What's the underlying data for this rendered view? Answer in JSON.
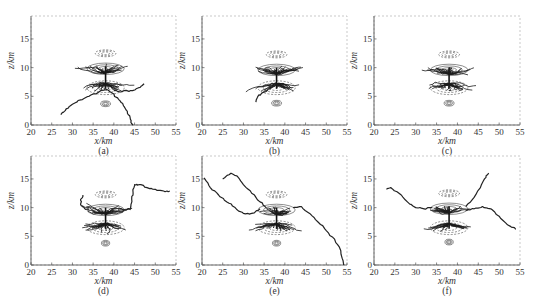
{
  "chart_data": [
    {
      "type": "line",
      "panel": "(a)",
      "xlabel": "x/km",
      "ylabel": "z/km",
      "xlim": [
        20,
        55
      ],
      "ylim": [
        0,
        19
      ],
      "xticks": [
        20,
        25,
        30,
        35,
        40,
        45,
        50,
        55
      ],
      "yticks": [
        0,
        5,
        10,
        15
      ],
      "grid": false,
      "charge_regions": [
        {
          "name": "upper-screening",
          "x": 38,
          "z": 12.5,
          "rx": 2.5,
          "rz": 0.6,
          "sign": "negative"
        },
        {
          "name": "upper-positive",
          "x": 38,
          "z": 9.8,
          "rx": 4.5,
          "rz": 1.0,
          "sign": "positive"
        },
        {
          "name": "main-negative",
          "x": 38,
          "z": 6.5,
          "rx": 4.5,
          "rz": 1.2,
          "sign": "negative"
        },
        {
          "name": "lower-positive",
          "x": 38,
          "z": 3.7,
          "rx": 1.2,
          "rz": 0.5,
          "sign": "positive"
        }
      ],
      "channels": [
        {
          "name": "branch-left-down",
          "x": [
            38,
            36,
            34,
            32,
            30,
            28.5,
            27.2
          ],
          "z": [
            6.2,
            5.6,
            5.0,
            4.4,
            3.6,
            2.8,
            1.8
          ]
        },
        {
          "name": "branch-right-down",
          "x": [
            38,
            40,
            41.5,
            42.5,
            43.3,
            44,
            44.6
          ],
          "z": [
            6.2,
            5.4,
            4.2,
            3.2,
            2.0,
            1.0,
            0.0
          ]
        },
        {
          "name": "branch-right-up",
          "x": [
            40,
            42,
            44,
            46,
            47.3
          ],
          "z": [
            6.0,
            5.8,
            6.0,
            6.5,
            7.2
          ]
        }
      ]
    },
    {
      "type": "line",
      "panel": "(b)",
      "xlabel": "x/km",
      "ylabel": "z/km",
      "xlim": [
        20,
        55
      ],
      "ylim": [
        0,
        19
      ],
      "xticks": [
        20,
        25,
        30,
        35,
        40,
        45,
        50,
        55
      ],
      "yticks": [
        0,
        5,
        10,
        15
      ],
      "grid": false,
      "charge_regions": [
        {
          "name": "upper-screening",
          "x": 38,
          "z": 12.3,
          "rx": 2.5,
          "rz": 0.6,
          "sign": "negative"
        },
        {
          "name": "upper-positive",
          "x": 38,
          "z": 9.6,
          "rx": 4.5,
          "rz": 1.0,
          "sign": "positive"
        },
        {
          "name": "main-negative",
          "x": 38,
          "z": 6.5,
          "rx": 4.5,
          "rz": 1.2,
          "sign": "negative"
        },
        {
          "name": "lower-positive",
          "x": 38,
          "z": 3.8,
          "rx": 1.2,
          "rz": 0.5,
          "sign": "positive"
        }
      ],
      "channels": [
        {
          "name": "branch-left-down",
          "x": [
            36,
            34.5,
            33.5,
            33
          ],
          "z": [
            6.2,
            5.6,
            5.0,
            4.0
          ]
        }
      ]
    },
    {
      "type": "line",
      "panel": "(c)",
      "xlabel": "x/km",
      "ylabel": "z/km",
      "xlim": [
        20,
        55
      ],
      "ylim": [
        0,
        19
      ],
      "xticks": [
        20,
        25,
        30,
        35,
        40,
        45,
        50,
        55
      ],
      "yticks": [
        0,
        5,
        10,
        15
      ],
      "grid": false,
      "charge_regions": [
        {
          "name": "upper-screening",
          "x": 38,
          "z": 12.3,
          "rx": 2.5,
          "rz": 0.6,
          "sign": "negative"
        },
        {
          "name": "upper-positive",
          "x": 38,
          "z": 9.6,
          "rx": 4.5,
          "rz": 1.0,
          "sign": "positive"
        },
        {
          "name": "main-negative",
          "x": 38,
          "z": 6.5,
          "rx": 4.5,
          "rz": 1.2,
          "sign": "negative"
        },
        {
          "name": "lower-positive",
          "x": 38,
          "z": 3.8,
          "rx": 1.2,
          "rz": 0.5,
          "sign": "positive"
        }
      ],
      "channels": []
    },
    {
      "type": "line",
      "panel": "(d)",
      "xlabel": "x/km",
      "ylabel": "z/km",
      "xlim": [
        20,
        55
      ],
      "ylim": [
        0,
        19
      ],
      "xticks": [
        20,
        25,
        30,
        35,
        40,
        45,
        50,
        55
      ],
      "yticks": [
        0,
        5,
        10,
        15
      ],
      "grid": false,
      "charge_regions": [
        {
          "name": "upper-screening",
          "x": 38,
          "z": 12.3,
          "rx": 2.5,
          "rz": 0.6,
          "sign": "negative"
        },
        {
          "name": "upper-positive",
          "x": 38,
          "z": 9.6,
          "rx": 4.5,
          "rz": 1.0,
          "sign": "positive"
        },
        {
          "name": "main-negative",
          "x": 38,
          "z": 6.5,
          "rx": 4.5,
          "rz": 1.2,
          "sign": "negative"
        },
        {
          "name": "lower-positive",
          "x": 38,
          "z": 3.8,
          "rx": 1.0,
          "rz": 0.5,
          "sign": "positive"
        }
      ],
      "channels": [
        {
          "name": "branch-left-up",
          "x": [
            34,
            33,
            32.2,
            32,
            32.5
          ],
          "z": [
            9.8,
            9.8,
            10.3,
            11.2,
            12.2
          ]
        },
        {
          "name": "branch-right-up",
          "x": [
            41,
            43,
            44,
            44.3,
            44.6,
            45,
            46,
            48,
            50,
            52,
            53.5
          ],
          "z": [
            9.8,
            9.6,
            9.8,
            11.5,
            13.0,
            14.0,
            14.0,
            13.5,
            13.2,
            12.9,
            12.9
          ]
        }
      ]
    },
    {
      "type": "line",
      "panel": "(e)",
      "xlabel": "x/km",
      "ylabel": "z/km",
      "xlim": [
        20,
        55
      ],
      "ylim": [
        0,
        19
      ],
      "xticks": [
        20,
        25,
        30,
        35,
        40,
        45,
        50,
        55
      ],
      "yticks": [
        0,
        5,
        10,
        15
      ],
      "grid": false,
      "charge_regions": [
        {
          "name": "upper-screening",
          "x": 38,
          "z": 12.3,
          "rx": 2.5,
          "rz": 0.6,
          "sign": "negative"
        },
        {
          "name": "upper-positive",
          "x": 38,
          "z": 9.6,
          "rx": 4.5,
          "rz": 1.0,
          "sign": "positive"
        },
        {
          "name": "main-negative",
          "x": 38,
          "z": 6.5,
          "rx": 4.5,
          "rz": 1.2,
          "sign": "negative"
        },
        {
          "name": "lower-positive",
          "x": 38,
          "z": 3.8,
          "rx": 1.0,
          "rz": 0.5,
          "sign": "positive"
        }
      ],
      "channels": [
        {
          "name": "branch-far-left",
          "x": [
            20.5,
            22,
            24,
            26,
            28,
            30,
            32,
            34
          ],
          "z": [
            15.2,
            13.5,
            12.2,
            11.0,
            10.0,
            9.0,
            9.0,
            9.8
          ]
        },
        {
          "name": "branch-left-peak",
          "x": [
            25,
            27,
            28.5,
            30,
            32,
            34,
            35.5
          ],
          "z": [
            15.0,
            16.0,
            15.5,
            14.0,
            12.5,
            11.0,
            10.0
          ]
        },
        {
          "name": "branch-right-down",
          "x": [
            42,
            44,
            46,
            48,
            50,
            52,
            53.5,
            54.2
          ],
          "z": [
            10.0,
            10.2,
            9.0,
            7.5,
            6.0,
            4.5,
            2.5,
            0.0
          ]
        }
      ]
    },
    {
      "type": "line",
      "panel": "(f)",
      "xlabel": "x/km",
      "ylabel": "z/km",
      "xlim": [
        20,
        55
      ],
      "ylim": [
        0,
        19
      ],
      "xticks": [
        20,
        25,
        30,
        35,
        40,
        45,
        50,
        55
      ],
      "yticks": [
        0,
        5,
        10,
        15
      ],
      "grid": false,
      "charge_regions": [
        {
          "name": "upper-screening",
          "x": 38,
          "z": 12.5,
          "rx": 2.5,
          "rz": 0.6,
          "sign": "negative"
        },
        {
          "name": "upper-positive",
          "x": 38,
          "z": 9.8,
          "rx": 4.5,
          "rz": 1.0,
          "sign": "positive"
        },
        {
          "name": "main-negative",
          "x": 38,
          "z": 6.5,
          "rx": 4.5,
          "rz": 1.2,
          "sign": "negative"
        },
        {
          "name": "lower-positive",
          "x": 38,
          "z": 4.0,
          "rx": 1.0,
          "rz": 0.5,
          "sign": "positive"
        }
      ],
      "channels": [
        {
          "name": "branch-left",
          "x": [
            23,
            24,
            26,
            28,
            30,
            32,
            34
          ],
          "z": [
            13.2,
            13.5,
            12.5,
            11.0,
            10.0,
            9.8,
            10.0
          ]
        },
        {
          "name": "branch-up-right",
          "x": [
            42,
            44,
            45.5,
            46.5,
            47.5
          ],
          "z": [
            10.2,
            11.8,
            13.5,
            15.0,
            16.0
          ]
        },
        {
          "name": "branch-right-down",
          "x": [
            42,
            44,
            46,
            48,
            50,
            52,
            54
          ],
          "z": [
            9.5,
            9.8,
            10.2,
            9.8,
            8.5,
            7.0,
            6.2
          ]
        }
      ]
    }
  ]
}
